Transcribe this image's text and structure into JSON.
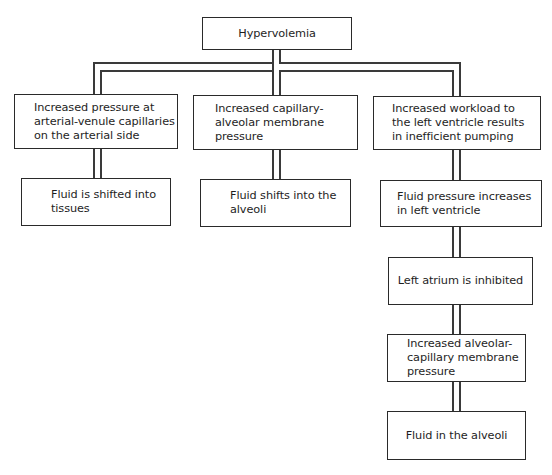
{
  "diagram": {
    "type": "flowchart",
    "root": {
      "id": "hypervolemia",
      "label": "Hypervolemia"
    },
    "branches": [
      {
        "id": "branch-left",
        "nodes": [
          {
            "id": "increased-pressure-arterial",
            "label": "Increased pressure at\narterial-venule capillaries\non the arterial side"
          },
          {
            "id": "fluid-shifted-tissues",
            "label": "Fluid is shifted into\ntissues"
          }
        ]
      },
      {
        "id": "branch-middle",
        "nodes": [
          {
            "id": "increased-capillary-alveolar",
            "label": "Increased capillary-\nalveolar membrane\npressure"
          },
          {
            "id": "fluid-shifts-alveoli",
            "label": "Fluid shifts into the\nalveoli"
          }
        ]
      },
      {
        "id": "branch-right",
        "nodes": [
          {
            "id": "increased-workload-lv",
            "label": "Increased workload to\nthe left ventricle results\nin inefficient pumping"
          },
          {
            "id": "fluid-pressure-lv",
            "label": "Fluid pressure increases\nin left ventricle"
          },
          {
            "id": "left-atrium-inhibited",
            "label": "Left atrium is inhibited"
          },
          {
            "id": "increased-alveolar-capillary",
            "label": "Increased alveolar-\ncapillary membrane\npressure"
          },
          {
            "id": "fluid-in-alveoli",
            "label": "Fluid in the alveoli"
          }
        ]
      }
    ],
    "edges": [
      [
        "hypervolemia",
        "increased-pressure-arterial"
      ],
      [
        "hypervolemia",
        "increased-capillary-alveolar"
      ],
      [
        "hypervolemia",
        "increased-workload-lv"
      ],
      [
        "increased-pressure-arterial",
        "fluid-shifted-tissues"
      ],
      [
        "increased-capillary-alveolar",
        "fluid-shifts-alveoli"
      ],
      [
        "increased-workload-lv",
        "fluid-pressure-lv"
      ],
      [
        "fluid-pressure-lv",
        "left-atrium-inhibited"
      ],
      [
        "left-atrium-inhibited",
        "increased-alveolar-capillary"
      ],
      [
        "increased-alveolar-capillary",
        "fluid-in-alveoli"
      ]
    ],
    "colors": {
      "line": "#3a3a3a",
      "box_border": "#2a2a2a",
      "text": "#1e1e1e",
      "background": "#ffffff"
    }
  }
}
